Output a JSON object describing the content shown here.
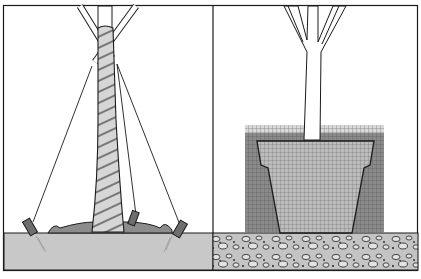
{
  "figure": {
    "description": "Two-panel line illustration of tree planting",
    "panels": [
      {
        "id": "left",
        "subject": "staked tree with guy wires, wrapped trunk, mulch mound and angled stakes in soil"
      },
      {
        "id": "right",
        "subject": "tree in container pot shown in cross-section within grid-hatched planting area above gravel/rock layer"
      }
    ],
    "colors": {
      "line": "#1a1a1a",
      "soil": "#c8c8c8",
      "mulch": "#8c8c8c",
      "trunk_wrap": "#d6d6d6",
      "grid_dark": "#7a7a7a",
      "grid_light": "#b4b4b4",
      "gravel": "#bdbdbd",
      "background": "#ffffff"
    }
  }
}
